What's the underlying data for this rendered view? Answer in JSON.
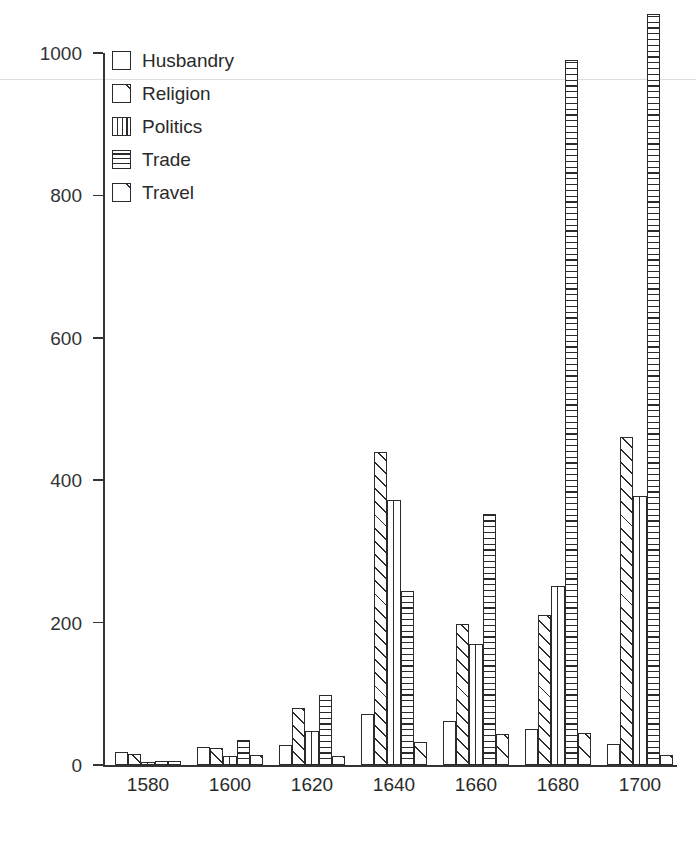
{
  "chart_data": {
    "type": "bar",
    "title": "",
    "subtitle": "",
    "xlabel": "",
    "ylabel": "",
    "categories": [
      "1580",
      "1600",
      "1620",
      "1640",
      "1660",
      "1680",
      "1700"
    ],
    "series": [
      {
        "name": "Husbandry",
        "pattern": "blank",
        "values": [
          18,
          25,
          28,
          72,
          62,
          50,
          30
        ]
      },
      {
        "name": "Religion",
        "pattern": "diagonal",
        "values": [
          15,
          24,
          80,
          440,
          198,
          210,
          460
        ]
      },
      {
        "name": "Politics",
        "pattern": "vertical",
        "values": [
          4,
          12,
          48,
          372,
          170,
          252,
          378
        ]
      },
      {
        "name": "Trade",
        "pattern": "horizontal",
        "values": [
          6,
          35,
          98,
          245,
          352,
          990,
          1055
        ]
      },
      {
        "name": "Travel",
        "pattern": "diagonal-one",
        "values": [
          5,
          14,
          12,
          32,
          43,
          45,
          14
        ]
      }
    ],
    "ylim": [
      0,
      1100
    ],
    "yticks": [
      0,
      200,
      400,
      600,
      800,
      1000
    ],
    "ytick_labels": [
      "0",
      "200",
      "400",
      "600",
      "800",
      "1000"
    ],
    "grid": false,
    "legend_position": "top-left",
    "legend_entries": [
      "Husbandry",
      "Religion",
      "Politics",
      "Trade",
      "Travel"
    ],
    "colors": {
      "ink": "#2b2b2b",
      "axis": "#343434",
      "background": "#ffffff"
    }
  }
}
